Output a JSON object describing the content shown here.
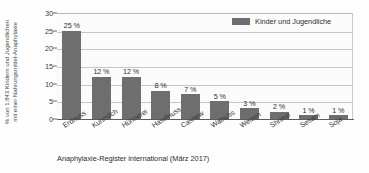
{
  "chart_data": {
    "type": "bar",
    "title": "",
    "subtitle": "",
    "categories": [
      "Erdnuss",
      "Kuhmilch",
      "Hühnerei",
      "Haselnuss",
      "Cashew",
      "Walnuss",
      "Weizen",
      "Shrimp",
      "Sesam",
      "Soja"
    ],
    "values": [
      25,
      12,
      12,
      8,
      7,
      5,
      3,
      2,
      1,
      1
    ],
    "data_labels": [
      "25 %",
      "12 %",
      "12 %",
      "8 %",
      "7 %",
      "5 %",
      "3 %",
      "2 %",
      "1 %",
      "1 %"
    ],
    "series": [
      {
        "name": "Kinder und Jugendliche",
        "values": [
          25,
          12,
          12,
          8,
          7,
          5,
          3,
          2,
          1,
          1
        ],
        "color": "#6e6e6e"
      }
    ],
    "xlabel": "",
    "ylabel_line1": "% von 1.843 Kindern und Jugendlichen",
    "ylabel_line2": "mit einer Nahrungsmittel-Anaphylaxie",
    "ylim": [
      0,
      30
    ],
    "yticks": [
      30,
      25,
      20,
      15,
      10,
      5,
      0
    ],
    "ytick_labels": [
      "30",
      "25",
      "20",
      "15",
      "10",
      "5",
      "0"
    ],
    "grid": true,
    "grid_axis": "y",
    "legend_position": "top-right",
    "legend_entries": [
      "Kinder und Jugendliche"
    ],
    "caption": "Anaphylaxie-Register international (März 2017)",
    "colors": {
      "bar": "#6e6e6e",
      "grid": "#c6c6c6",
      "axis": "#5c5c5c",
      "plot_background": "#fbfbfb",
      "text": "#2e2e2e"
    }
  }
}
